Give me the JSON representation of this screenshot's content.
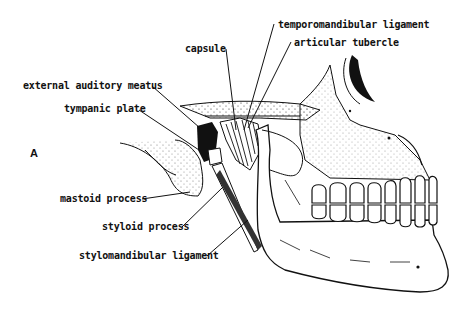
{
  "figure": {
    "panel_letter": "A",
    "labels": [
      {
        "id": "temporomandibular-ligament",
        "text": "temporomandibular ligament"
      },
      {
        "id": "capsule",
        "text": "capsule"
      },
      {
        "id": "articular-tubercle",
        "text": "articular tubercle"
      },
      {
        "id": "external-auditory-meatus",
        "text": "external auditory meatus"
      },
      {
        "id": "tympanic-plate",
        "text": "tympanic plate"
      },
      {
        "id": "mastoid-process",
        "text": "mastoid process"
      },
      {
        "id": "styloid-process",
        "text": "styloid process"
      },
      {
        "id": "stylomandibular-ligament",
        "text": "stylomandibular ligament"
      }
    ],
    "colors": {
      "ink": "#111111",
      "background": "#ffffff"
    }
  }
}
